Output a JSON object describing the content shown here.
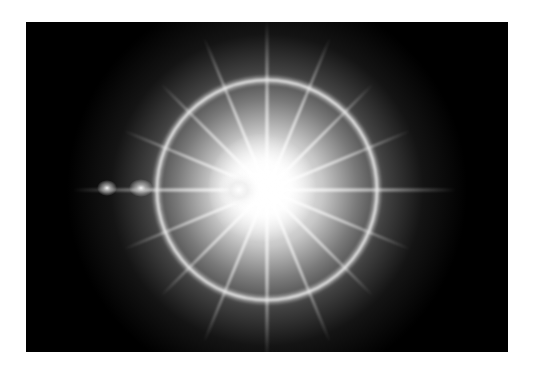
{
  "image": {
    "description": "Lens flare starburst with halo ring on black background",
    "background_color": "#000000",
    "border_color": "#ffffff",
    "flare": {
      "center": [
        241,
        168
      ],
      "ring_radius": 110,
      "ray_count": 16,
      "core_color": "#ffffff",
      "glow_color": "#b8b8b8",
      "secondary_spots": [
        [
          115,
          166
        ],
        [
          81,
          166
        ]
      ]
    }
  }
}
